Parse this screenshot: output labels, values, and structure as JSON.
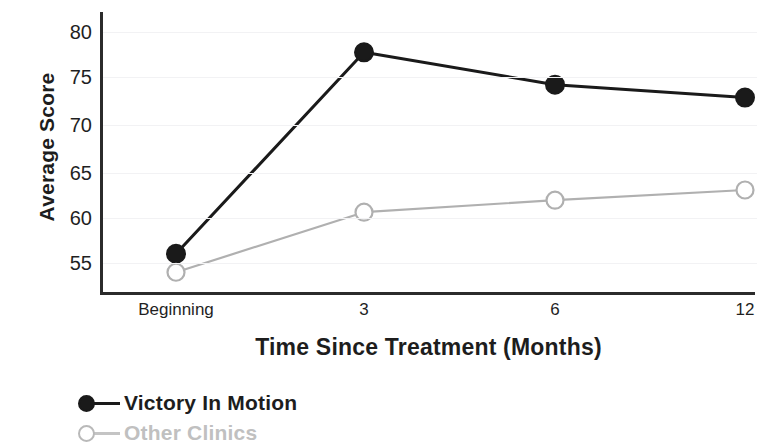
{
  "chart_data": {
    "type": "line",
    "title": "",
    "xlabel": "Time Since Treatment (Months)",
    "ylabel": "Average Score",
    "categories": [
      "Beginning",
      "3",
      "6",
      "12"
    ],
    "ylim": [
      53,
      81
    ],
    "yticks": [
      55,
      60,
      65,
      70,
      75,
      80
    ],
    "ytick_labels": [
      "55",
      "60",
      "65",
      "70",
      "75",
      "80"
    ],
    "grid": "horizontal",
    "legend_position": "below-left",
    "series": [
      {
        "name": "Victory In Motion",
        "values": [
          56.0,
          77.8,
          74.3,
          72.9
        ],
        "color": "#1a1a1a",
        "marker": "filled-circle"
      },
      {
        "name": "Other Clinics",
        "values": [
          54.0,
          60.5,
          61.8,
          62.9
        ],
        "color": "#b0b0b0",
        "marker": "open-circle"
      }
    ]
  },
  "axes": {
    "y_title": "Average Score",
    "x_title": "Time Since Treatment (Months)",
    "y_tick_labels": [
      "80",
      "75",
      "70",
      "65",
      "60",
      "55"
    ],
    "x_tick_labels": [
      "Beginning",
      "3",
      "6",
      "12"
    ]
  },
  "legend": {
    "items": [
      {
        "label": "Victory In Motion",
        "color": "#1a1a1a",
        "marker": "filled-circle"
      },
      {
        "label": "Other Clinics",
        "color": "#b9b9b9",
        "marker": "open-circle"
      }
    ]
  },
  "colors": {
    "series_primary": "#1a1a1a",
    "series_secondary": "#b0b0b0",
    "axis": "#2b2b2b",
    "grid": "#f2f2f4",
    "background": "#ffffff"
  }
}
